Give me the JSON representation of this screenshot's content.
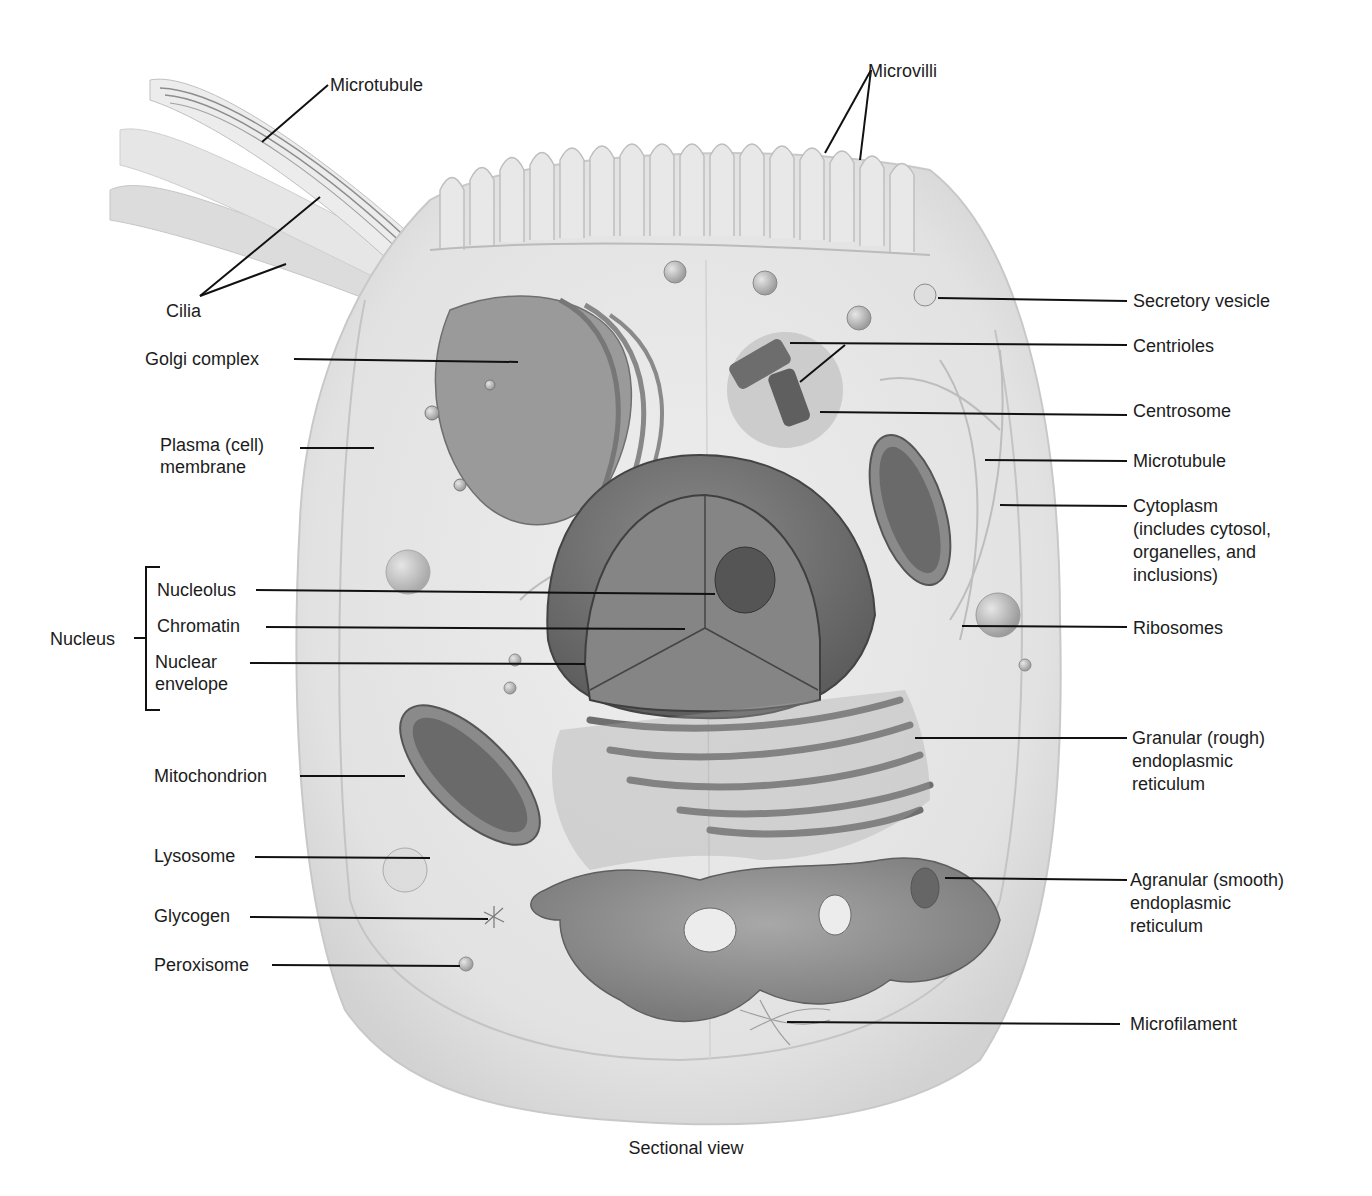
{
  "caption": "Sectional view",
  "labels": {
    "microtubule_cilium": "Microtubule",
    "microvilli": "Microvilli",
    "cilia": "Cilia",
    "golgi": "Golgi complex",
    "plasma_membrane_1": "Plasma (cell)",
    "plasma_membrane_2": "membrane",
    "nucleus": "Nucleus",
    "nucleolus": "Nucleolus",
    "chromatin": "Chromatin",
    "nuclear_envelope_1": "Nuclear",
    "nuclear_envelope_2": "envelope",
    "mitochondrion": "Mitochondrion",
    "lysosome": "Lysosome",
    "glycogen": "Glycogen",
    "peroxisome": "Peroxisome",
    "secretory_vesicle": "Secretory vesicle",
    "centrioles": "Centrioles",
    "centrosome": "Centrosome",
    "microtubule_right": "Microtubule",
    "cytoplasm_1": "Cytoplasm",
    "cytoplasm_2": "(includes cytosol,",
    "cytoplasm_3": "organelles, and",
    "cytoplasm_4": "inclusions)",
    "ribosomes": "Ribosomes",
    "rough_er_1": "Granular (rough)",
    "rough_er_2": "endoplasmic",
    "rough_er_3": "reticulum",
    "smooth_er_1": "Agranular (smooth)",
    "smooth_er_2": "endoplasmic",
    "smooth_er_3": "reticulum",
    "microfilament": "Microfilament"
  },
  "colors": {
    "background": "#ffffff",
    "cell_fill": "#e9e9e9",
    "cytoplasm_fill": "#dedede",
    "organelle_dark": "#6e6e6e",
    "organelle_mid": "#9a9a9a",
    "leader_line": "#111111",
    "text": "#1c1c1c"
  }
}
